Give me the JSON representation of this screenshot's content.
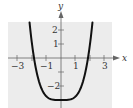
{
  "chart_data": {
    "type": "line",
    "title": "",
    "xlabel": "x",
    "ylabel": "y",
    "xlim": [
      -3.6,
      3.5
    ],
    "ylim": [
      -3.4,
      2.5
    ],
    "grid": false,
    "legend": null,
    "x_ticks": [
      -3,
      -2,
      -1,
      0,
      1,
      2,
      3
    ],
    "x_tick_labels": [
      "-3",
      "-1",
      "1",
      "3"
    ],
    "y_ticks": [
      -3,
      -2,
      -1,
      1,
      2
    ],
    "y_tick_labels": [
      "-2",
      "1",
      "2"
    ],
    "series": [
      {
        "name": "f(x)",
        "description": "Quartic curve, approx y = x^4/4 - 3",
        "x": [
          -2.17,
          -2.0,
          -1.9,
          -1.5,
          -1.0,
          -0.5,
          0,
          0.5,
          1.0,
          1.5,
          1.9,
          2.0,
          2.17
        ],
        "y": [
          2.5,
          1.0,
          0.26,
          -1.73,
          -2.75,
          -2.98,
          -3.0,
          -2.98,
          -2.75,
          -1.73,
          0.26,
          1.0,
          2.5
        ]
      }
    ],
    "background": "#ececec",
    "curve_color": "#111111"
  },
  "labels": {
    "x_axis": "x",
    "y_axis": "y",
    "x_neg3": "−3",
    "x_neg1": "−1",
    "x_1": "1",
    "x_3": "3",
    "y_2": "2",
    "y_1": "1",
    "y_neg2": "−2"
  }
}
